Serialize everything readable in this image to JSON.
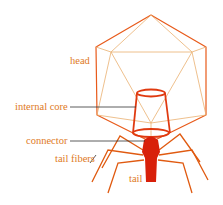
{
  "diagram": {
    "labels": {
      "head": "head",
      "internal_core": "internal core",
      "connector": "connector",
      "tail_fibers": "tail fibers",
      "tail": "tail"
    },
    "colors": {
      "outline_orange": "#e8962e",
      "outline_red": "#e03a10",
      "solid_red": "#d8200a",
      "label_text": "#e07a1e",
      "leader_line": "#333333"
    }
  }
}
